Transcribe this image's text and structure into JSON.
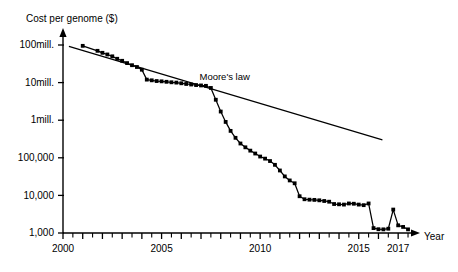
{
  "chart_data": {
    "type": "line",
    "title": "Cost per genome ($)",
    "xlabel": "Year",
    "ylabel": "Cost per genome ($)",
    "yscale": "log",
    "ylim": [
      1000,
      100000000
    ],
    "xlim": [
      2000,
      2017.6
    ],
    "grid": false,
    "legend": "none",
    "y_tick_labels": [
      "100mill.",
      "10mill.",
      "1mill.",
      "100,000",
      "10,000",
      "1,000"
    ],
    "y_tick_values": [
      100000000,
      10000000,
      1000000,
      100000,
      10000,
      1000
    ],
    "x_tick_labels": [
      "2000",
      "2005",
      "2010",
      "2015",
      "2017"
    ],
    "x_tick_values": [
      2000,
      2005,
      2010,
      2015,
      2017
    ],
    "x_minor_tick_step": 0.5,
    "annotations": [
      {
        "text": "Moore's law",
        "x": 2008.2,
        "y": 12000000
      }
    ],
    "series": [
      {
        "name": "Cost per genome",
        "marker": "square",
        "color": "#000000",
        "x": [
          2001.0,
          2001.75,
          2002.0,
          2002.25,
          2002.5,
          2002.75,
          2003.0,
          2003.25,
          2003.5,
          2003.75,
          2004.0,
          2004.25,
          2004.5,
          2004.75,
          2005.0,
          2005.25,
          2005.5,
          2005.75,
          2006.0,
          2006.25,
          2006.5,
          2006.75,
          2007.0,
          2007.25,
          2007.5,
          2007.75,
          2008.0,
          2008.25,
          2008.5,
          2008.75,
          2009.0,
          2009.25,
          2009.5,
          2009.75,
          2010.0,
          2010.25,
          2010.5,
          2010.75,
          2011.0,
          2011.25,
          2011.5,
          2011.75,
          2012.0,
          2012.25,
          2012.5,
          2012.75,
          2013.0,
          2013.25,
          2013.5,
          2013.75,
          2014.0,
          2014.25,
          2014.5,
          2014.75,
          2015.0,
          2015.25,
          2015.5,
          2015.75,
          2016.0,
          2016.25,
          2016.5,
          2016.75,
          2017.0,
          2017.25,
          2017.5
        ],
        "y": [
          95000000,
          70000000,
          62000000,
          56000000,
          50000000,
          43000000,
          38000000,
          33000000,
          29000000,
          26000000,
          22000000,
          12000000,
          11500000,
          11000000,
          10800000,
          10500000,
          10200000,
          10000000,
          9600000,
          9200000,
          8900000,
          8600000,
          8400000,
          8200000,
          7200000,
          3500000,
          1700000,
          900000,
          520000,
          340000,
          240000,
          190000,
          155000,
          130000,
          108000,
          95000,
          82000,
          65000,
          46000,
          32000,
          25000,
          21000,
          9500,
          7900,
          7700,
          7600,
          7400,
          7100,
          6800,
          5900,
          5800,
          5700,
          6100,
          6000,
          5700,
          5500,
          6100,
          1350,
          1260,
          1250,
          1300,
          4200,
          1600,
          1450,
          1250
        ]
      }
    ],
    "reference_line": {
      "name": "Moore's law",
      "x": [
        2000.3,
        2016.2
      ],
      "y": [
        92000000,
        300000
      ]
    }
  }
}
